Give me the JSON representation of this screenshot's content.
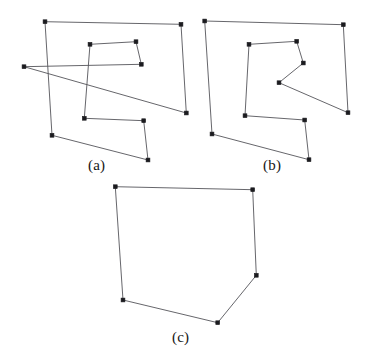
{
  "figure": {
    "background_color": "#ffffff",
    "edge_color": "#55555a",
    "vertex_color": "#1b1b1f",
    "width": 367,
    "height": 357
  },
  "captions": {
    "a": "(a)",
    "b": "(b)",
    "c": "(c)"
  },
  "chart_data": {
    "type": "scatter",
    "xlabel": "",
    "ylabel": "",
    "xlim": [
      0,
      367
    ],
    "ylim": [
      357,
      0
    ],
    "grid": false,
    "legend": "none",
    "annotations": [
      "(a)",
      "(b)",
      "(c)"
    ],
    "panels": [
      {
        "label": "(a)",
        "caption": "(a)",
        "description": "self-intersecting closed polygon on 12 points",
        "closed": true,
        "vertex_count": 12,
        "points": [
          [
            45,
            21.7
          ],
          [
            181,
            24.3
          ],
          [
            186.3,
            113
          ],
          [
            24,
            66.7
          ],
          [
            141.3,
            64.3
          ],
          [
            136,
            41.7
          ],
          [
            90,
            44.3
          ],
          [
            84.3,
            118.3
          ],
          [
            143.7,
            120.7
          ],
          [
            148,
            160
          ],
          [
            52,
            135.3
          ],
          [
            45,
            21.7
          ]
        ],
        "vertices": [
          [
            45,
            21.7
          ],
          [
            181,
            24.3
          ],
          [
            186.3,
            113
          ],
          [
            24,
            66.7
          ],
          [
            141.3,
            64.3
          ],
          [
            136,
            41.7
          ],
          [
            90,
            44.3
          ],
          [
            84.3,
            118.3
          ],
          [
            143.7,
            120.7
          ],
          [
            148,
            160
          ],
          [
            52,
            135.3
          ]
        ]
      },
      {
        "label": "(b)",
        "caption": "(b)",
        "description": "simple (non self-intersecting) polygon on the same 12 points",
        "closed": true,
        "vertex_count": 12,
        "points": [
          [
            204.7,
            21
          ],
          [
            343.3,
            24.7
          ],
          [
            348,
            112.7
          ],
          [
            279,
            82.7
          ],
          [
            303.3,
            63
          ],
          [
            296.7,
            41.3
          ],
          [
            249,
            44.3
          ],
          [
            245,
            115.7
          ],
          [
            304.7,
            120
          ],
          [
            309,
            159.7
          ],
          [
            212,
            134
          ],
          [
            204.7,
            21
          ]
        ],
        "vertices": [
          [
            204.7,
            21
          ],
          [
            343.3,
            24.7
          ],
          [
            348,
            112.7
          ],
          [
            279,
            82.7
          ],
          [
            303.3,
            63
          ],
          [
            296.7,
            41.3
          ],
          [
            249,
            44.3
          ],
          [
            245,
            115.7
          ],
          [
            304.7,
            120
          ],
          [
            309,
            159.7
          ],
          [
            212,
            134
          ]
        ]
      },
      {
        "label": "(c)",
        "caption": "(c)",
        "description": "convex hull of the point set",
        "closed": true,
        "vertex_count": 6,
        "points": [
          [
            115.3,
            186.7
          ],
          [
            252.7,
            189.7
          ],
          [
            256.3,
            275.3
          ],
          [
            217.7,
            322.7
          ],
          [
            123,
            300
          ],
          [
            115.3,
            186.7
          ]
        ],
        "vertices": [
          [
            115.3,
            186.7
          ],
          [
            252.7,
            189.7
          ],
          [
            256.3,
            275.3
          ],
          [
            217.7,
            322.7
          ],
          [
            123,
            300
          ]
        ]
      }
    ]
  }
}
